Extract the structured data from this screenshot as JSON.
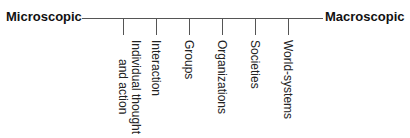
{
  "diagram": {
    "left_label": "Microscopic",
    "right_label": "Macroscopic",
    "levels": [
      {
        "label": "Individual thought\nand action"
      },
      {
        "label": "Interaction"
      },
      {
        "label": "Groups"
      },
      {
        "label": "Organizations"
      },
      {
        "label": "Societies"
      },
      {
        "label": "World-systems"
      }
    ]
  }
}
